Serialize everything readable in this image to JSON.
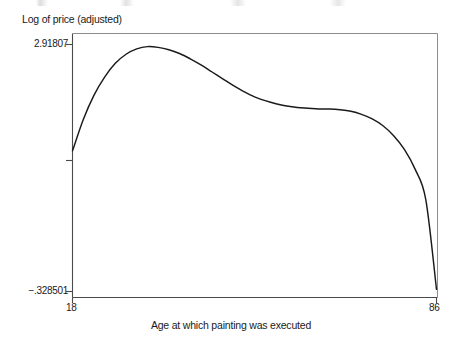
{
  "chart_data": {
    "type": "line",
    "title": "",
    "xlabel": "Age at which painting was executed",
    "ylabel": "Log of price (adjusted)",
    "xlim": [
      18,
      86
    ],
    "ylim": [
      -0.328501,
      2.91807
    ],
    "xticks": [
      18,
      86
    ],
    "xticklabels": [
      "18",
      "86"
    ],
    "yticks": [
      -0.328501,
      2.91807
    ],
    "yticklabels": [
      "−.328501",
      "2.91807"
    ],
    "grid": false,
    "legend": null,
    "series": [
      {
        "name": "Log of price (adjusted)",
        "x": [
          18,
          20,
          22,
          24,
          26,
          28,
          30,
          32,
          34,
          36,
          38,
          40,
          42,
          44,
          46,
          48,
          50,
          52,
          54,
          56,
          58,
          60,
          62,
          64,
          66,
          68,
          70,
          72,
          74,
          76,
          78,
          80,
          82,
          84,
          86
        ],
        "y": [
          1.52,
          1.93,
          2.25,
          2.49,
          2.67,
          2.79,
          2.86,
          2.89,
          2.88,
          2.85,
          2.8,
          2.73,
          2.65,
          2.56,
          2.47,
          2.38,
          2.3,
          2.23,
          2.18,
          2.14,
          2.11,
          2.09,
          2.08,
          2.07,
          2.07,
          2.06,
          2.04,
          2.0,
          1.94,
          1.85,
          1.72,
          1.54,
          1.28,
          0.88,
          -0.3
        ]
      }
    ]
  },
  "axis_labels": {
    "y_axis_title": "Log of price (adjusted)",
    "x_axis_title": "Age at which painting was executed",
    "y_tick_top": "−.328501",
    "y_tick_top_value": "2.91807",
    "y_tick_bottom": "−.328501",
    "x_tick_left": "18",
    "x_tick_right": "86"
  },
  "style": {
    "line_color": "#1a1a1a",
    "axis_color": "#4a4a4a",
    "background": "#ffffff"
  }
}
